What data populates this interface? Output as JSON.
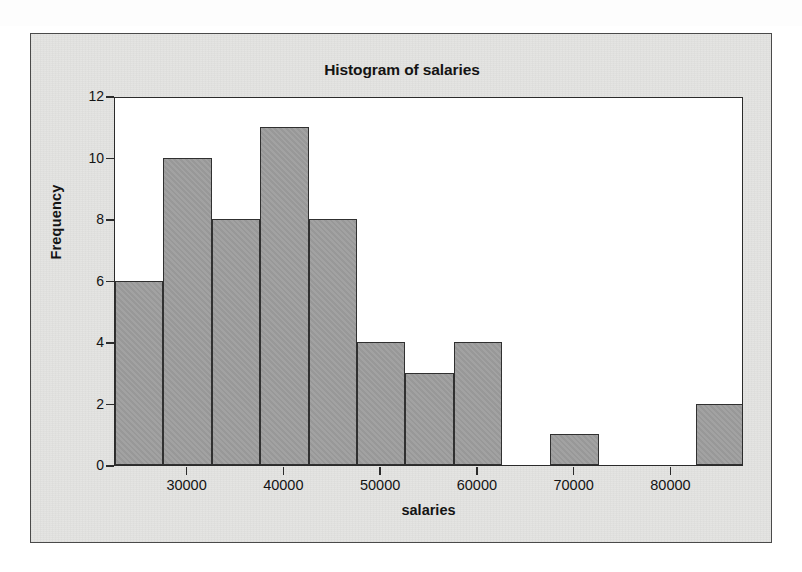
{
  "figure": {
    "title": "Histogram of salaries"
  },
  "chart_data": {
    "type": "bar",
    "title": "Histogram of salaries",
    "xlabel": "salaries",
    "ylabel": "Frequency",
    "xlim": [
      22500,
      87500
    ],
    "ylim": [
      0,
      12
    ],
    "grid": false,
    "legend": null,
    "bin_width": 5000,
    "bins": [
      {
        "left": 22500,
        "right": 27500,
        "count": 6
      },
      {
        "left": 27500,
        "right": 32500,
        "count": 10
      },
      {
        "left": 32500,
        "right": 37500,
        "count": 8
      },
      {
        "left": 37500,
        "right": 42500,
        "count": 11
      },
      {
        "left": 42500,
        "right": 47500,
        "count": 8
      },
      {
        "left": 47500,
        "right": 52500,
        "count": 4
      },
      {
        "left": 52500,
        "right": 57500,
        "count": 3
      },
      {
        "left": 57500,
        "right": 62500,
        "count": 4
      },
      {
        "left": 62500,
        "right": 67500,
        "count": 0
      },
      {
        "left": 67500,
        "right": 72500,
        "count": 1
      },
      {
        "left": 72500,
        "right": 77500,
        "count": 0
      },
      {
        "left": 77500,
        "right": 82500,
        "count": 0
      },
      {
        "left": 82500,
        "right": 87500,
        "count": 2
      }
    ],
    "categories": [
      "22500-27500",
      "27500-32500",
      "32500-37500",
      "37500-42500",
      "42500-47500",
      "47500-52500",
      "52500-57500",
      "57500-62500",
      "62500-67500",
      "67500-72500",
      "72500-77500",
      "77500-82500",
      "82500-87500"
    ],
    "values": [
      6,
      10,
      8,
      11,
      8,
      4,
      3,
      4,
      0,
      1,
      0,
      0,
      2
    ],
    "x_ticks": [
      {
        "value": 30000,
        "label": "30000"
      },
      {
        "value": 40000,
        "label": "40000"
      },
      {
        "value": 50000,
        "label": "50000"
      },
      {
        "value": 60000,
        "label": "60000"
      },
      {
        "value": 70000,
        "label": "70000"
      },
      {
        "value": 80000,
        "label": "80000"
      }
    ],
    "y_ticks": [
      {
        "value": 0,
        "label": "0"
      },
      {
        "value": 2,
        "label": "2"
      },
      {
        "value": 4,
        "label": "4"
      },
      {
        "value": 6,
        "label": "6"
      },
      {
        "value": 8,
        "label": "8"
      },
      {
        "value": 10,
        "label": "10"
      },
      {
        "value": 12,
        "label": "12"
      }
    ],
    "colors": {
      "bar_fill": "#9d9d9d",
      "bar_edge": "#303030",
      "plot_background": "#ffffff",
      "figure_background": "#e3e3e1",
      "text": "#141414"
    }
  }
}
